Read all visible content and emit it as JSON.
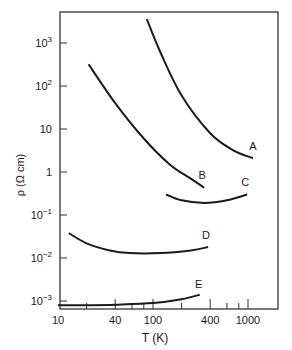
{
  "chart_data": {
    "type": "line",
    "title": "",
    "xlabel": "T (K)",
    "ylabel": "ρ (Ω cm)",
    "xscale": "log",
    "yscale": "log",
    "xlim": [
      10,
      2000
    ],
    "ylim": [
      0.0007,
      30000
    ],
    "grid": false,
    "legend": "inline curve labels",
    "x_ticks": [
      {
        "value": 10,
        "label": "10"
      },
      {
        "value": 40,
        "label": "40"
      },
      {
        "value": 100,
        "label": "100"
      },
      {
        "value": 400,
        "label": "400"
      },
      {
        "value": 1000,
        "label": "1000"
      }
    ],
    "x_minor_ticks": [
      20,
      60,
      80,
      200,
      600,
      800
    ],
    "y_ticks": [
      {
        "value": 1000,
        "base": "10",
        "exp": "3"
      },
      {
        "value": 100,
        "base": "10",
        "exp": "2"
      },
      {
        "value": 10,
        "base": "10",
        "exp": ""
      },
      {
        "value": 1,
        "base": "1",
        "exp": ""
      },
      {
        "value": 0.1,
        "base": "10",
        "exp": "−1"
      },
      {
        "value": 0.01,
        "base": "10",
        "exp": "−2"
      },
      {
        "value": 0.001,
        "base": "10",
        "exp": "−3"
      }
    ],
    "series": [
      {
        "name": "A",
        "points": [
          [
            86,
            3600
          ],
          [
            120,
            600
          ],
          [
            200,
            60
          ],
          [
            400,
            8
          ],
          [
            700,
            3.2
          ],
          [
            1130,
            2.1
          ]
        ]
      },
      {
        "name": "B",
        "points": [
          [
            21,
            320
          ],
          [
            40,
            40
          ],
          [
            80,
            6
          ],
          [
            150,
            1.5
          ],
          [
            250,
            0.7
          ],
          [
            345,
            0.43
          ]
        ]
      },
      {
        "name": "C",
        "points": [
          [
            137,
            0.3
          ],
          [
            200,
            0.22
          ],
          [
            350,
            0.19
          ],
          [
            600,
            0.22
          ],
          [
            980,
            0.3
          ]
        ]
      },
      {
        "name": "D",
        "points": [
          [
            13,
            0.038
          ],
          [
            20,
            0.022
          ],
          [
            35,
            0.015
          ],
          [
            57,
            0.013
          ],
          [
            120,
            0.013
          ],
          [
            250,
            0.015
          ],
          [
            380,
            0.018
          ]
        ]
      },
      {
        "name": "E",
        "points": [
          [
            10,
            0.0008
          ],
          [
            20,
            0.0008
          ],
          [
            40,
            0.00082
          ],
          [
            100,
            0.0009
          ],
          [
            200,
            0.0011
          ],
          [
            310,
            0.0014
          ]
        ]
      }
    ]
  }
}
